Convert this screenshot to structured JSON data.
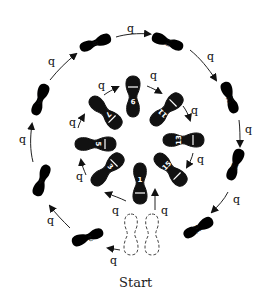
{
  "start_label": "Start",
  "timing_label": "q",
  "colors": {
    "ink": "#111111",
    "background": "#ffffff"
  },
  "outer_steps": [
    {
      "n": "2",
      "label": "2",
      "foot": "white",
      "x": 88,
      "y": 237,
      "rot": 70
    },
    {
      "n": "4",
      "label": "4",
      "foot": "white",
      "x": 42,
      "y": 180,
      "rot": 20
    },
    {
      "n": "6",
      "label": "6",
      "foot": "white",
      "x": 40,
      "y": 100,
      "rot": 200
    },
    {
      "n": "8",
      "label": "8",
      "foot": "white",
      "x": 95,
      "y": 43,
      "rot": 250
    },
    {
      "n": "10",
      "label": "10",
      "foot": "white",
      "x": 168,
      "y": 42,
      "rot": 110
    },
    {
      "n": "12",
      "label": "12",
      "foot": "white",
      "x": 230,
      "y": 98,
      "rot": 160
    },
    {
      "n": "14",
      "label": "14",
      "foot": "white",
      "x": 235,
      "y": 165,
      "rot": 200
    },
    {
      "n": "16",
      "label": "16",
      "foot": "white",
      "x": 198,
      "y": 228,
      "rot": 240
    }
  ],
  "inner_steps": [
    {
      "n": "1",
      "label": "1",
      "foot": "black",
      "x": 140,
      "y": 183,
      "rot": 0
    },
    {
      "n": "3",
      "label": "3",
      "foot": "black",
      "x": 107,
      "y": 170,
      "rot": 225
    },
    {
      "n": "5",
      "label": "5",
      "foot": "black",
      "x": 95,
      "y": 144,
      "rot": 270
    },
    {
      "n": "7",
      "label": "7",
      "foot": "black",
      "x": 105,
      "y": 112,
      "rot": 315
    },
    {
      "n": "9",
      "label": "9",
      "foot": "black",
      "x": 133,
      "y": 97,
      "rot": 0
    },
    {
      "n": "11",
      "label": "11",
      "foot": "black",
      "x": 166,
      "y": 110,
      "rot": 45
    },
    {
      "n": "13",
      "label": "13",
      "foot": "black",
      "x": 183,
      "y": 140,
      "rot": 90
    },
    {
      "n": "15",
      "label": "15",
      "foot": "black",
      "x": 170,
      "y": 169,
      "rot": 135
    }
  ],
  "start_position": {
    "feet": [
      "left",
      "right"
    ],
    "style": "dashed"
  }
}
